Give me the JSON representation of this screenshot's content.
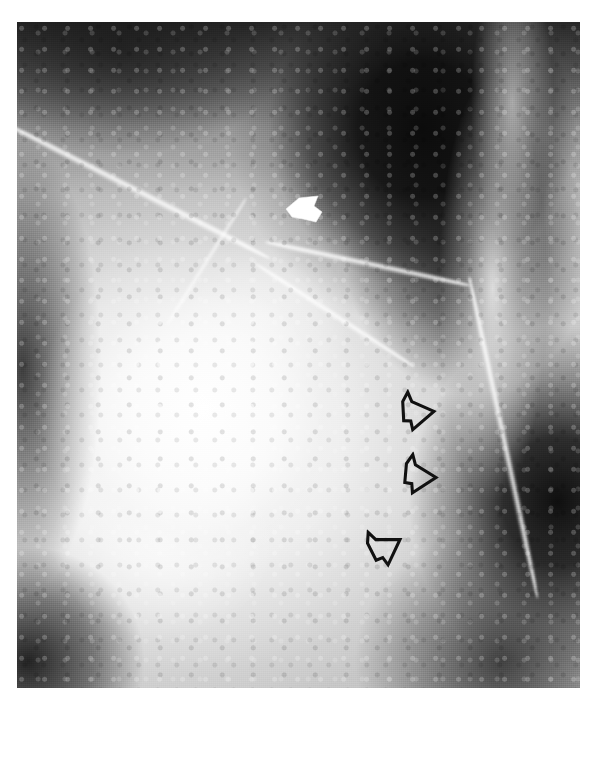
{
  "figure": {
    "modality": "mammogram-radiograph",
    "plate": {
      "left": 17,
      "top": 22,
      "width": 563,
      "height": 666
    },
    "page": {
      "width": 598,
      "height": 784,
      "background_color": "#ffffff"
    },
    "tone": {
      "plate_base_color": "#8d8d8d",
      "darkest_color": "#060606",
      "brightest_color": "#ffffff",
      "marker_outline_color": "#111111",
      "marker_fill_color": "#ffffff"
    }
  },
  "regions": [
    {
      "name": "dark-upper-right-fat",
      "description": "dense black fatty / retroglandular region occupying the upper right"
    },
    {
      "name": "bright-glandular-mass",
      "description": "bright dense glandular mass centred left of middle"
    },
    {
      "name": "dark-lower-right-corner",
      "description": "dark region at the lower right corner"
    },
    {
      "name": "dark-lower-left-wedge",
      "description": "dark wedge along the lower left edge"
    },
    {
      "name": "bright-right-border",
      "description": "bright curving tissue border running down the right side"
    }
  ],
  "vessels": [
    {
      "name": "main-diagonal-vessel",
      "description": "long bright linear vessel descending from the upper left toward the centre junction"
    },
    {
      "name": "upper-right-branch",
      "description": "shallow bright branch continuing to the right from the junction"
    },
    {
      "name": "lower-branch",
      "description": "bright branch descending to the right from the junction"
    },
    {
      "name": "right-border-vessel",
      "description": "near vertical bright line along the right breast border"
    },
    {
      "name": "left-curve-branch",
      "description": "short curving bright branch left of the centre"
    }
  ],
  "markers": {
    "white_arrowhead": {
      "name": "solid-white-arrowhead",
      "style": "solid filled",
      "fill": "#ffffff",
      "direction": "left",
      "x": 284,
      "y": 195,
      "width": 40,
      "height": 30,
      "description": "Solid white arrowhead pointing left, placed at the vessel junction in the upper middle of the plate."
    },
    "open_arrows": [
      {
        "name": "open-arrow-1",
        "style": "outlined hollow",
        "stroke": "#111111",
        "fill": "transparent",
        "direction": "right",
        "x": 398,
        "y": 388,
        "width": 42,
        "height": 50,
        "rotation_deg": -6
      },
      {
        "name": "open-arrow-2",
        "style": "outlined hollow",
        "stroke": "#111111",
        "fill": "transparent",
        "direction": "right",
        "x": 400,
        "y": 452,
        "width": 42,
        "height": 50,
        "rotation_deg": 2
      },
      {
        "name": "open-arrow-3",
        "style": "outlined hollow",
        "stroke": "#111111",
        "fill": "transparent",
        "direction": "upper-right",
        "x": 366,
        "y": 522,
        "width": 42,
        "height": 50,
        "rotation_deg": -30
      }
    ],
    "open_arrow_count": 3,
    "white_arrowhead_count": 1
  },
  "artifacts": [
    {
      "name": "scan-artifact-left",
      "x": 238,
      "y": 772,
      "width": 22,
      "height": 5
    },
    {
      "name": "scan-artifact-right",
      "x": 486,
      "y": 770,
      "width": 16,
      "height": 7
    }
  ],
  "caption": {
    "text": ""
  }
}
